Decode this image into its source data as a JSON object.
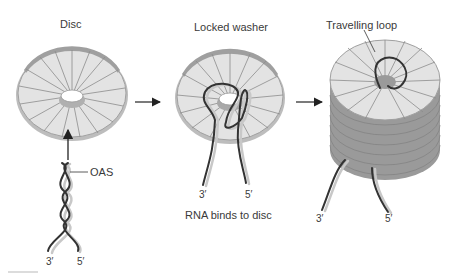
{
  "panels": [
    {
      "title": "Disc",
      "label": "OAS",
      "end3": "3′",
      "end5": "5′"
    },
    {
      "title": "Locked washer",
      "caption": "RNA binds to disc",
      "end3": "3′",
      "end5": "5′"
    },
    {
      "title": "Travelling loop",
      "end3": "3′",
      "end5": "5′"
    }
  ],
  "colors": {
    "disc_fill": "#d9d9d9",
    "disc_rim": "#a8a8a8",
    "spoke": "#8a8a8a",
    "rna": "#333333",
    "rna_shadow": "#c8c8c8"
  }
}
